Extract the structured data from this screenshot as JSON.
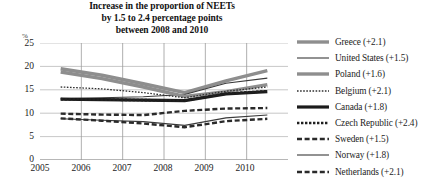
{
  "title": {
    "line1": "Increase in the proportion of NEETs",
    "line2": "by 1.5 to 2.4 percentage points",
    "line3": "between 2008 and 2010"
  },
  "axes": {
    "y_unit": "%",
    "y_ticks": [
      "25",
      "20",
      "15",
      "10",
      "5",
      "0"
    ],
    "x_ticks": [
      "2005",
      "2006",
      "2007",
      "2008",
      "2009",
      "2010"
    ]
  },
  "legend": {
    "items": [
      {
        "label": "Greece (+2.1)",
        "style": "thick-gray"
      },
      {
        "label": "United States (+1.5)",
        "style": "thin-solid"
      },
      {
        "label": "Poland (+1.6)",
        "style": "thick-gray"
      },
      {
        "label": "Belgium (+2.1)",
        "style": "fine-dotted"
      },
      {
        "label": "Canada (+1.8)",
        "style": "thick-black"
      },
      {
        "label": "Czech Republic (+2.4)",
        "style": "dotted"
      },
      {
        "label": "Sweden (+1.5)",
        "style": "dashed"
      },
      {
        "label": "Norway (+1.8)",
        "style": "thin-solid"
      },
      {
        "label": "Netherlands (+2.1)",
        "style": "dashed"
      }
    ]
  },
  "chart_data": {
    "type": "line",
    "title": "Increase in the proportion of NEETs by 1.5 to 2.4 percentage points between 2008 and 2010",
    "xlabel": "",
    "ylabel": "%",
    "x": [
      2005,
      2006,
      2007,
      2008,
      2009,
      2010
    ],
    "ylim": [
      0,
      25
    ],
    "y_ticks": [
      0,
      5,
      10,
      15,
      20,
      25
    ],
    "grid": true,
    "legend_position": "right",
    "series": [
      {
        "name": "Greece (+2.1)",
        "values": [
          19.5,
          18.1,
          16.3,
          14.4,
          16.9,
          19.1
        ],
        "style": "thick-gray"
      },
      {
        "name": "United States (+1.5)",
        "values": [
          13.1,
          13.3,
          13.5,
          14.0,
          16.4,
          17.5
        ],
        "style": "thin-solid"
      },
      {
        "name": "Poland (+1.6)",
        "values": [
          18.8,
          17.4,
          15.6,
          13.6,
          14.6,
          16.1
        ],
        "style": "thick-gray"
      },
      {
        "name": "Belgium (+2.1)",
        "values": [
          15.6,
          15.2,
          14.4,
          13.3,
          14.7,
          15.6
        ],
        "style": "fine-dotted"
      },
      {
        "name": "Canada (+1.8)",
        "values": [
          13.0,
          12.9,
          12.8,
          12.7,
          14.1,
          14.6
        ],
        "style": "thick-black"
      },
      {
        "name": "Czech Republic (+2.4)",
        "values": [
          13.0,
          12.9,
          12.8,
          12.7,
          14.2,
          14.7
        ],
        "style": "dotted"
      },
      {
        "name": "Sweden (+1.5)",
        "values": [
          9.9,
          9.7,
          9.6,
          10.5,
          11.0,
          11.1
        ],
        "style": "dashed"
      },
      {
        "name": "Norway (+1.8)",
        "values": [
          8.8,
          8.5,
          8.2,
          7.4,
          9.0,
          9.6
        ],
        "style": "thin-solid"
      },
      {
        "name": "Netherlands (+2.1)",
        "values": [
          8.9,
          8.4,
          7.8,
          7.0,
          8.3,
          8.8
        ],
        "style": "dashed"
      }
    ]
  }
}
